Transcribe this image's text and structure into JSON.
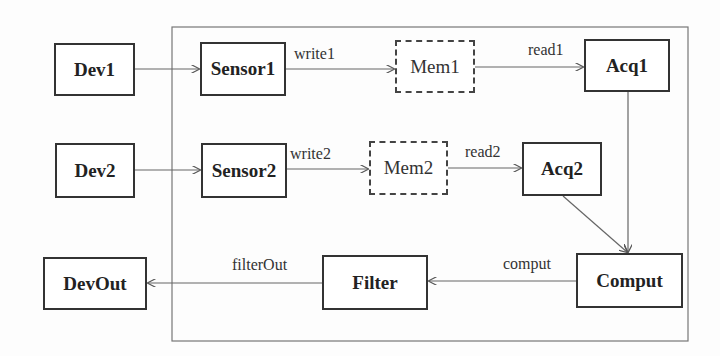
{
  "diagram": {
    "container": {
      "x": 172,
      "y": 27,
      "w": 516,
      "h": 314
    },
    "nodes": {
      "dev1": {
        "label": "Dev1",
        "style": "solid"
      },
      "dev2": {
        "label": "Dev2",
        "style": "solid"
      },
      "sensor1": {
        "label": "Sensor1",
        "style": "solid"
      },
      "sensor2": {
        "label": "Sensor2",
        "style": "solid"
      },
      "mem1": {
        "label": "Mem1",
        "style": "dashed"
      },
      "mem2": {
        "label": "Mem2",
        "style": "dashed"
      },
      "acq1": {
        "label": "Acq1",
        "style": "solid"
      },
      "acq2": {
        "label": "Acq2",
        "style": "solid"
      },
      "comput": {
        "label": "Comput",
        "style": "solid"
      },
      "filter": {
        "label": "Filter",
        "style": "solid"
      },
      "devout": {
        "label": "DevOut",
        "style": "solid"
      }
    },
    "edges": [
      {
        "from": "dev1",
        "to": "sensor1",
        "label": ""
      },
      {
        "from": "dev2",
        "to": "sensor2",
        "label": ""
      },
      {
        "from": "sensor1",
        "to": "mem1",
        "label": "write1"
      },
      {
        "from": "sensor2",
        "to": "mem2",
        "label": "write2"
      },
      {
        "from": "mem1",
        "to": "acq1",
        "label": "read1"
      },
      {
        "from": "mem2",
        "to": "acq2",
        "label": "read2"
      },
      {
        "from": "acq1",
        "to": "comput",
        "label": ""
      },
      {
        "from": "acq2",
        "to": "comput",
        "label": ""
      },
      {
        "from": "comput",
        "to": "filter",
        "label": "comput"
      },
      {
        "from": "filter",
        "to": "devout",
        "label": "filterOut"
      }
    ],
    "colors": {
      "line": "#666666",
      "box_border": "#333333",
      "background": "#fdfdfd"
    }
  }
}
